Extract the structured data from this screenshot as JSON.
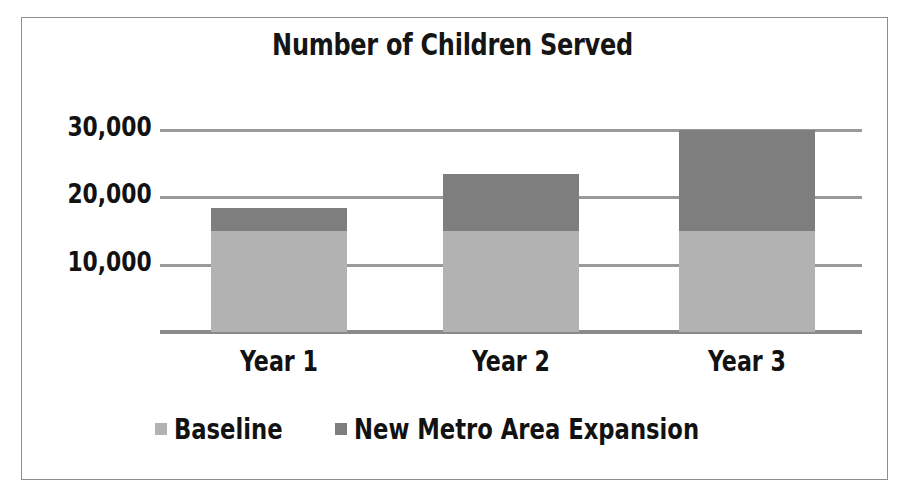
{
  "chart_data": {
    "type": "bar",
    "subtype": "stacked",
    "title": "Number of Children Served",
    "xlabel": "",
    "ylabel": "",
    "categories": [
      "Year 1",
      "Year 2",
      "Year 3"
    ],
    "series": [
      {
        "name": "Baseline",
        "values": [
          15000,
          15000,
          15000
        ],
        "color": "#b2b2b2"
      },
      {
        "name": "New Metro Area Expansion",
        "values": [
          3500,
          8500,
          15000
        ],
        "color": "#7e7e7e"
      }
    ],
    "totals": [
      18500,
      23500,
      30000
    ],
    "ylim": [
      0,
      33000
    ],
    "yticks": [
      10000,
      20000,
      30000
    ],
    "ytick_labels": [
      "10,000",
      "20,000",
      "30,000"
    ],
    "grid": true,
    "legend_position": "bottom"
  },
  "legend": {
    "entries": [
      {
        "label": "Baseline",
        "swatch": "baseline-swatch"
      },
      {
        "label": "New Metro Area Expansion",
        "swatch": "expansion-swatch"
      }
    ]
  },
  "colors": {
    "baseline": "#b2b2b2",
    "expansion": "#7e7e7e",
    "gridline": "#9a9a9a",
    "axis": "#8a8a8a",
    "text": "#121212",
    "frame": "#8e8e8e",
    "background": "#ffffff"
  }
}
